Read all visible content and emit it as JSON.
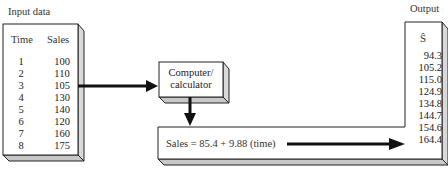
{
  "input": {
    "title": "Input data",
    "headers": [
      "Time",
      "Sales"
    ],
    "time": [
      "1",
      "2",
      "3",
      "4",
      "5",
      "6",
      "7",
      "8"
    ],
    "sales": [
      "100",
      "110",
      "105",
      "130",
      "140",
      "120",
      "160",
      "175"
    ]
  },
  "processor": {
    "line1": "Computer/",
    "line2": "calculator"
  },
  "equation": {
    "text": "Sales = 85.4 + 9.88 (time)"
  },
  "output": {
    "title": "Output",
    "header": "Ŝ",
    "values": [
      "94.3",
      "105.2",
      "115.0",
      "124.9",
      "134.8",
      "144.7",
      "154.6",
      "164.4"
    ]
  },
  "colors": {
    "box_face": "#ffffff",
    "box_side": "#d9d9d9",
    "box_bottom": "#c8c8c8",
    "stroke": "#222222",
    "arrow": "#111111"
  }
}
